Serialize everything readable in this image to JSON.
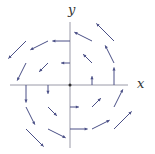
{
  "axes": {
    "x_label": "x",
    "y_label": "y",
    "origin_px": [
      70,
      85
    ],
    "unit_px": 22,
    "x_axis_px": [
      10,
      128
    ],
    "y_axis_px": [
      22,
      148
    ],
    "axis_color": "#9a9aa8",
    "arrow_color": "#4a4f86"
  },
  "chart_data": {
    "type": "vector_field",
    "title": "",
    "field": "F(x,y) = (-y, x)",
    "xlabel": "x",
    "ylabel": "y",
    "xlim": [
      -2.7,
      2.7
    ],
    "ylim": [
      -2.9,
      2.9
    ],
    "vectors": [
      {
        "x": 1,
        "y": 0,
        "dx": 0,
        "dy": 0.4
      },
      {
        "x": 2,
        "y": 0,
        "dx": 0,
        "dy": 0.8
      },
      {
        "x": -1,
        "y": 0,
        "dx": 0,
        "dy": -0.4
      },
      {
        "x": -2,
        "y": 0,
        "dx": 0,
        "dy": -0.8
      },
      {
        "x": 0,
        "y": 1,
        "dx": -0.4,
        "dy": 0
      },
      {
        "x": 0,
        "y": 2,
        "dx": -0.8,
        "dy": 0
      },
      {
        "x": 0,
        "y": -1,
        "dx": 0.4,
        "dy": 0
      },
      {
        "x": 0,
        "y": -2,
        "dx": 0.8,
        "dy": 0
      },
      {
        "x": 1,
        "y": 1,
        "dx": -0.4,
        "dy": 0.4
      },
      {
        "x": -1,
        "y": 1,
        "dx": -0.4,
        "dy": -0.4
      },
      {
        "x": -1,
        "y": -1,
        "dx": 0.4,
        "dy": -0.4
      },
      {
        "x": 1,
        "y": -1,
        "dx": 0.4,
        "dy": 0.4
      },
      {
        "x": 2,
        "y": 1,
        "dx": -0.4,
        "dy": 0.8
      },
      {
        "x": 1,
        "y": 2,
        "dx": -0.8,
        "dy": 0.4
      },
      {
        "x": -1,
        "y": 2,
        "dx": -0.8,
        "dy": -0.4
      },
      {
        "x": -2,
        "y": 1,
        "dx": -0.4,
        "dy": -0.8
      },
      {
        "x": -2,
        "y": -1,
        "dx": 0.4,
        "dy": -0.8
      },
      {
        "x": -1,
        "y": -2,
        "dx": 0.8,
        "dy": -0.4
      },
      {
        "x": 1,
        "y": -2,
        "dx": 0.8,
        "dy": 0.4
      },
      {
        "x": 2,
        "y": -1,
        "dx": 0.4,
        "dy": 0.8
      },
      {
        "x": 2,
        "y": 2,
        "dx": -0.8,
        "dy": 0.8
      },
      {
        "x": -2,
        "y": 2,
        "dx": -0.8,
        "dy": -0.8
      },
      {
        "x": -2,
        "y": -2,
        "dx": 0.8,
        "dy": -0.8
      },
      {
        "x": 2,
        "y": -2,
        "dx": 0.8,
        "dy": 0.8
      }
    ]
  }
}
